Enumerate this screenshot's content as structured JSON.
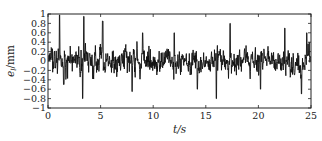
{
  "chart_data": {
    "type": "line",
    "title": "",
    "xlabel": "t/s",
    "ylabel": "e_l/mm",
    "xlim": [
      0,
      25
    ],
    "ylim": [
      -1,
      1
    ],
    "x_ticks": [
      0,
      5,
      10,
      15,
      20,
      25
    ],
    "x_tick_labels": [
      "0",
      "5",
      "10",
      "15",
      "20",
      "25"
    ],
    "y_ticks": [
      1,
      0.8,
      0.6,
      0.4,
      0.2,
      0,
      -0.2,
      -0.4,
      -0.6,
      -0.8,
      -1
    ],
    "y_tick_labels": [
      "1",
      "0.8",
      "0.6",
      "0.4",
      "0.2",
      "0",
      "−0.2",
      "−0.4",
      "−0.6",
      "−0.8",
      "−1"
    ],
    "grid": false,
    "legend": null,
    "series": [
      {
        "name": "e_l",
        "color": "#111111",
        "description": "dense random-vibration error signal fluctuating around 0, mostly within ±0.5 mm, peaks near +1 (t≈1, t≈3.5) and troughs near -0.8 (t≈3.3, t≈14.5, t≈16)",
        "x_start": 0,
        "x_end": 25,
        "n_points": 900,
        "amplitude_rms": 0.22,
        "peaks": [
          {
            "t": 1.1,
            "v": 0.98
          },
          {
            "t": 3.4,
            "v": 0.95
          },
          {
            "t": 3.3,
            "v": -0.8
          },
          {
            "t": 5.2,
            "v": 0.85
          },
          {
            "t": 1.5,
            "v": -0.5
          },
          {
            "t": 8.0,
            "v": -0.65
          },
          {
            "t": 9.0,
            "v": 0.6
          },
          {
            "t": 12.0,
            "v": 0.6
          },
          {
            "t": 14.2,
            "v": -0.6
          },
          {
            "t": 16.0,
            "v": -0.8
          },
          {
            "t": 17.3,
            "v": 0.8
          },
          {
            "t": 20.2,
            "v": -0.6
          },
          {
            "t": 22.5,
            "v": 0.7
          },
          {
            "t": 24.1,
            "v": -0.7
          },
          {
            "t": 24.6,
            "v": 0.6
          }
        ],
        "seed": 7
      }
    ]
  }
}
